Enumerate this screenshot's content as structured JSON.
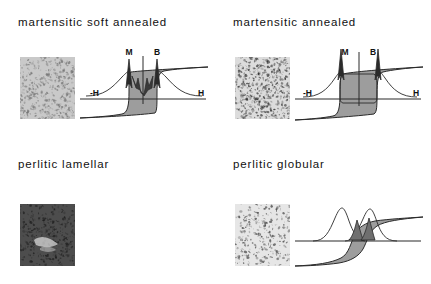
{
  "figure": {
    "background_color": "#ffffff",
    "ink_color": "#1a1a1a",
    "loop_fill_color": "#9a9a9a",
    "micrograph_frame_color": "#8c8c8c"
  },
  "panels": [
    {
      "id": "martensitic-soft-annealed",
      "title": "martensitic soft annealed",
      "micrograph": {
        "name": "martensitic-soft-annealed-micrograph",
        "tone": "light-fine-grained",
        "base_color": "#c8c8c8",
        "speckle_color": "#6e6e6e",
        "speckle_count": 900
      },
      "has_plot": true,
      "plot": {
        "axis_left_label": "-H",
        "axis_right_label": "H",
        "peak_labels": [
          "M",
          "B"
        ],
        "loop_width": "narrow",
        "description": "narrow steep hysteresis loop with two sharp tall Barkhausen peaks and a deep central notch"
      }
    },
    {
      "id": "martensitic-annealed",
      "title": "martensitic annealed",
      "micrograph": {
        "name": "martensitic-annealed-micrograph",
        "tone": "mottled-medium-contrast",
        "base_color": "#d8d8d8",
        "speckle_color": "#2e2e2e",
        "speckle_count": 1100
      },
      "has_plot": true,
      "plot": {
        "axis_left_label": "-H",
        "axis_right_label": "H",
        "peak_labels": [
          "M",
          "B"
        ],
        "loop_width": "wide",
        "description": "wide rectangular hysteresis loop with two very tall narrow Barkhausen peaks at the loop flanks"
      }
    },
    {
      "id": "perlitic-lamellar",
      "title": "perlitic lamellar",
      "micrograph": {
        "name": "perlitic-lamellar-micrograph",
        "tone": "dark-lamellar",
        "base_color": "#4a4a4a",
        "speckle_color": "#1a1a1a",
        "speckle_count": 700
      },
      "has_plot": false,
      "plot": null
    },
    {
      "id": "perlitic-globular",
      "title": "perlitic globular",
      "micrograph": {
        "name": "perlitic-globular-micrograph",
        "tone": "light-globular",
        "base_color": "#e4e4e4",
        "speckle_color": "#3a3a3a",
        "speckle_count": 620
      },
      "has_plot": true,
      "plot": {
        "axis_left_label": "",
        "axis_right_label": "",
        "peak_labels": [],
        "loop_width": "sheared",
        "description": "sheared S-shaped hysteresis loop with two broad overlapping Barkhausen bell curves, no axis letters"
      }
    }
  ],
  "chart_data": {
    "type": "line",
    "title": "",
    "xlabel": "H",
    "ylabel": "",
    "grid": false,
    "legend_position": "inline-annotations",
    "charts": [
      {
        "panel": "martensitic soft annealed",
        "annotations": [
          "M",
          "B",
          "-H",
          "H"
        ],
        "hysteresis_loop": {
          "coercivity_norm": 0.1,
          "remanence_norm": 0.78,
          "squareness": "high",
          "shape": "narrow-steep"
        },
        "barkhausen_peaks": [
          {
            "label": "M",
            "position_norm": -0.11,
            "height_norm": 0.95,
            "width_norm": 0.05
          },
          {
            "label": "B",
            "position_norm": 0.11,
            "height_norm": 0.93,
            "width_norm": 0.05
          }
        ],
        "broad_background_curves": [
          {
            "position_norm": -0.22,
            "height_norm": 0.3,
            "width_norm": 0.26
          },
          {
            "position_norm": 0.22,
            "height_norm": 0.3,
            "width_norm": 0.26
          }
        ]
      },
      {
        "panel": "martensitic annealed",
        "annotations": [
          "M",
          "B",
          "-H",
          "H"
        ],
        "hysteresis_loop": {
          "coercivity_norm": 0.3,
          "remanence_norm": 0.8,
          "squareness": "high",
          "shape": "wide-rectangular"
        },
        "barkhausen_peaks": [
          {
            "label": "M",
            "position_norm": -0.3,
            "height_norm": 1.0,
            "width_norm": 0.045
          },
          {
            "label": "B",
            "position_norm": 0.3,
            "height_norm": 1.0,
            "width_norm": 0.045
          }
        ],
        "broad_background_curves": [
          {
            "position_norm": -0.38,
            "height_norm": 0.26,
            "width_norm": 0.24
          },
          {
            "position_norm": 0.38,
            "height_norm": 0.26,
            "width_norm": 0.24
          }
        ]
      },
      {
        "panel": "perlitic globular",
        "annotations": [],
        "hysteresis_loop": {
          "coercivity_norm": 0.14,
          "remanence_norm": 0.45,
          "squareness": "low",
          "shape": "sheared-S"
        },
        "barkhausen_peaks": [
          {
            "label": "",
            "position_norm": -0.08,
            "height_norm": 0.62,
            "width_norm": 0.12
          },
          {
            "label": "",
            "position_norm": 0.1,
            "height_norm": 0.58,
            "width_norm": 0.12
          }
        ],
        "broad_background_curves": [
          {
            "position_norm": -0.26,
            "height_norm": 0.5,
            "width_norm": 0.17
          },
          {
            "position_norm": 0.26,
            "height_norm": 0.42,
            "width_norm": 0.17
          }
        ]
      }
    ]
  }
}
